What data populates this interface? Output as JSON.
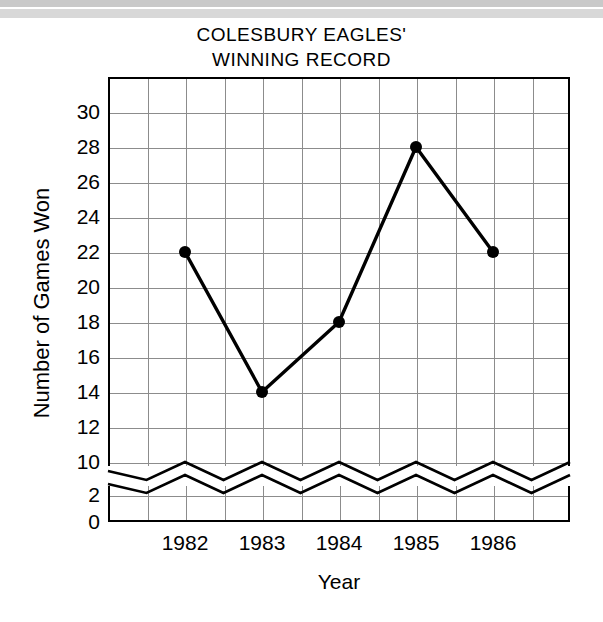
{
  "title_lines": [
    "COLESBURY EAGLES'",
    "WINNING RECORD"
  ],
  "axis": {
    "x_label": "Year",
    "y_label": "Number of Games Won"
  },
  "colors": {
    "line": "#000000",
    "marker": "#000000",
    "grid": "#8c8c8c",
    "frame": "#000000",
    "background": "#ffffff"
  },
  "chart_data": {
    "type": "line",
    "title": "COLESBURY EAGLES' WINNING RECORD",
    "xlabel": "Year",
    "ylabel": "Number of Games Won",
    "categories": [
      "1982",
      "1983",
      "1984",
      "1985",
      "1986"
    ],
    "x": [
      1982,
      1983,
      1984,
      1985,
      1986
    ],
    "values": [
      22,
      14,
      18,
      28,
      22
    ],
    "series": [
      {
        "name": "Games Won",
        "values": [
          22,
          14,
          18,
          28,
          22
        ]
      }
    ],
    "y_ticks": [
      0,
      2,
      10,
      12,
      14,
      16,
      18,
      20,
      22,
      24,
      26,
      28,
      30
    ],
    "y_ticks_labels": [
      "0",
      "2",
      "10",
      "12",
      "14",
      "16",
      "18",
      "20",
      "22",
      "24",
      "26",
      "28",
      "30"
    ],
    "ylim": [
      0,
      31
    ],
    "xlim": [
      1981.25,
      1987.5
    ],
    "axis_break": {
      "present": true,
      "between": [
        2,
        10
      ],
      "style": "zigzag"
    },
    "grid": true,
    "legend": "none",
    "marker": "filled-circle"
  },
  "y_tick_labels": [
    "30",
    "28",
    "26",
    "24",
    "22",
    "20",
    "18",
    "16",
    "14",
    "12",
    "10",
    "2",
    "0"
  ],
  "x_tick_labels": [
    "1982",
    "1983",
    "1984",
    "1985",
    "1986"
  ]
}
